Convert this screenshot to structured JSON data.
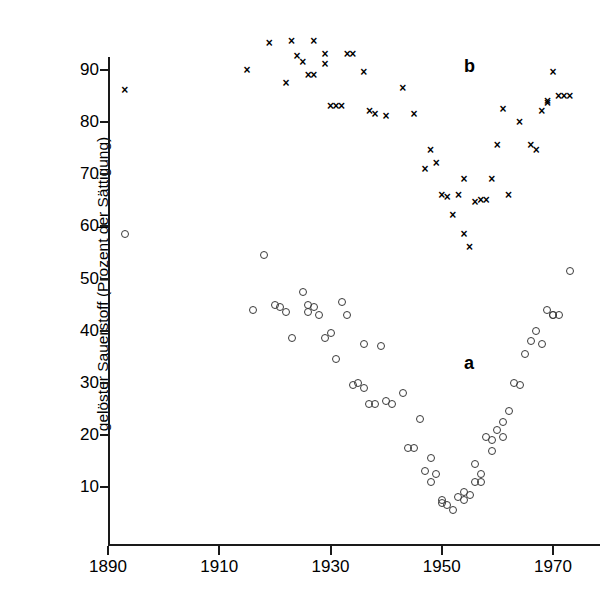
{
  "chart_data": {
    "type": "scatter",
    "title": "",
    "xlabel": "",
    "ylabel": "gelöster Sauerstoff (Prozent der Sättigung)",
    "xlim": [
      1888,
      1976
    ],
    "ylim": [
      0,
      98
    ],
    "xticks": [
      1890,
      1910,
      1930,
      1950,
      1970
    ],
    "yticks": [
      10,
      20,
      30,
      40,
      50,
      60,
      70,
      80,
      90
    ],
    "grid": false,
    "legend_position": "inline-annotation",
    "annotations": [
      {
        "text": "b",
        "x": 1954,
        "y": 92.5
      },
      {
        "text": "a",
        "x": 1954,
        "y": 35.5
      }
    ],
    "series": [
      {
        "name": "b",
        "marker": "x",
        "color": "#000000",
        "points": [
          [
            1893,
            86.0
          ],
          [
            1915,
            90.0
          ],
          [
            1919,
            95.0
          ],
          [
            1922,
            87.5
          ],
          [
            1923,
            95.5
          ],
          [
            1924,
            92.5
          ],
          [
            1925,
            91.5
          ],
          [
            1926,
            89.0
          ],
          [
            1927,
            95.5
          ],
          [
            1927,
            89.0
          ],
          [
            1929,
            93.0
          ],
          [
            1929,
            91.0
          ],
          [
            1930,
            83.0
          ],
          [
            1931,
            83.0
          ],
          [
            1932,
            83.0
          ],
          [
            1933,
            93.0
          ],
          [
            1934,
            93.0
          ],
          [
            1936,
            89.5
          ],
          [
            1937,
            82.0
          ],
          [
            1938,
            81.5
          ],
          [
            1940,
            81.0
          ],
          [
            1943,
            86.5
          ],
          [
            1945,
            81.5
          ],
          [
            1947,
            71.0
          ],
          [
            1948,
            74.5
          ],
          [
            1949,
            72.0
          ],
          [
            1950,
            66.0
          ],
          [
            1951,
            65.5
          ],
          [
            1952,
            62.0
          ],
          [
            1953,
            66.0
          ],
          [
            1954,
            69.0
          ],
          [
            1954,
            58.5
          ],
          [
            1955,
            56.0
          ],
          [
            1956,
            64.5
          ],
          [
            1957,
            65.0
          ],
          [
            1958,
            65.0
          ],
          [
            1959,
            69.0
          ],
          [
            1960,
            75.5
          ],
          [
            1961,
            82.5
          ],
          [
            1962,
            66.0
          ],
          [
            1964,
            80.0
          ],
          [
            1966,
            75.5
          ],
          [
            1967,
            74.5
          ],
          [
            1968,
            82.0
          ],
          [
            1969,
            84.0
          ],
          [
            1969,
            83.5
          ],
          [
            1970,
            89.5
          ],
          [
            1971,
            85.0
          ],
          [
            1972,
            85.0
          ],
          [
            1973,
            85.0
          ]
        ]
      },
      {
        "name": "a",
        "marker": "o",
        "color": "#3a3a3a",
        "points": [
          [
            1893,
            58.5
          ],
          [
            1916,
            44.0
          ],
          [
            1918,
            54.5
          ],
          [
            1920,
            45.0
          ],
          [
            1921,
            44.5
          ],
          [
            1922,
            43.5
          ],
          [
            1923,
            38.5
          ],
          [
            1925,
            47.5
          ],
          [
            1926,
            45.0
          ],
          [
            1926,
            43.5
          ],
          [
            1927,
            44.5
          ],
          [
            1928,
            43.0
          ],
          [
            1929,
            38.5
          ],
          [
            1930,
            39.5
          ],
          [
            1931,
            34.5
          ],
          [
            1932,
            45.5
          ],
          [
            1933,
            43.0
          ],
          [
            1934,
            29.5
          ],
          [
            1935,
            30.0
          ],
          [
            1936,
            37.5
          ],
          [
            1936,
            29.0
          ],
          [
            1937,
            26.0
          ],
          [
            1938,
            26.0
          ],
          [
            1939,
            37.0
          ],
          [
            1940,
            26.5
          ],
          [
            1941,
            26.0
          ],
          [
            1943,
            28.0
          ],
          [
            1944,
            17.5
          ],
          [
            1945,
            17.5
          ],
          [
            1946,
            23.0
          ],
          [
            1947,
            13.0
          ],
          [
            1948,
            15.5
          ],
          [
            1948,
            11.0
          ],
          [
            1949,
            12.5
          ],
          [
            1950,
            7.0
          ],
          [
            1950,
            7.5
          ],
          [
            1951,
            6.5
          ],
          [
            1952,
            5.5
          ],
          [
            1953,
            8.0
          ],
          [
            1954,
            9.0
          ],
          [
            1954,
            7.5
          ],
          [
            1955,
            8.5
          ],
          [
            1956,
            11.0
          ],
          [
            1956,
            14.5
          ],
          [
            1957,
            12.5
          ],
          [
            1957,
            11.0
          ],
          [
            1958,
            19.5
          ],
          [
            1959,
            17.0
          ],
          [
            1959,
            19.0
          ],
          [
            1960,
            21.0
          ],
          [
            1961,
            22.5
          ],
          [
            1961,
            19.5
          ],
          [
            1962,
            24.5
          ],
          [
            1963,
            30.0
          ],
          [
            1964,
            29.5
          ],
          [
            1965,
            35.5
          ],
          [
            1966,
            38.0
          ],
          [
            1967,
            40.0
          ],
          [
            1968,
            37.5
          ],
          [
            1969,
            44.0
          ],
          [
            1970,
            43.0
          ],
          [
            1970,
            43.0
          ],
          [
            1971,
            43.0
          ],
          [
            1973,
            51.5
          ]
        ]
      }
    ]
  },
  "axes": {
    "y_tick_labels": [
      "90",
      "80",
      "70",
      "60",
      "50",
      "40",
      "30",
      "20",
      "10"
    ],
    "x_tick_labels": [
      "1890",
      "1910",
      "1930",
      "1950",
      "1970"
    ]
  }
}
